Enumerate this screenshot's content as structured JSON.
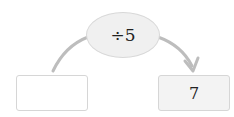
{
  "diagram": {
    "operation": "÷5",
    "input_value": "",
    "output_value": "7",
    "arrow_color": "#bdbdbd"
  }
}
